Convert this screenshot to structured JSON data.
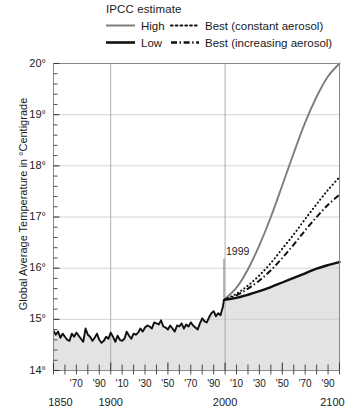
{
  "legend": {
    "title": "IPCC estimate",
    "entries": [
      {
        "label": "High",
        "style": "solid",
        "color": "#7d7d7d",
        "name": "legend-high"
      },
      {
        "label": "Best (constant aerosol)",
        "style": "dotted",
        "color": "#111111",
        "name": "legend-best-constant"
      },
      {
        "label": "Low",
        "style": "solid",
        "color": "#111111",
        "name": "legend-low"
      },
      {
        "label": "Best (increasing aerosol)",
        "style": "dashdot",
        "color": "#111111",
        "name": "legend-best-increasing"
      }
    ]
  },
  "axes": {
    "ylabel": "Global Average Temperature in °Centigrade",
    "yticks": [
      "14°",
      "15°",
      "16°",
      "17°",
      "18°",
      "19°",
      "20°"
    ],
    "xmajor": [
      "1850",
      "1900",
      "2000",
      "2100"
    ],
    "xminor": [
      "'70",
      "'90",
      "'10",
      "'30",
      "'50",
      "'70",
      "'90",
      "'10",
      "'30",
      "'50",
      "'70",
      "'90"
    ]
  },
  "annotations": [
    {
      "text": "1999",
      "name": "annotation-1999",
      "year": 1999
    }
  ],
  "chart_data": {
    "type": "line",
    "title": "IPCC estimate",
    "xlabel": "",
    "ylabel": "Global Average Temperature in °Centigrade",
    "xlim": [
      1850,
      2100
    ],
    "ylim": [
      14,
      20
    ],
    "grid": true,
    "legend_position": "top",
    "yticks": [
      14,
      15,
      16,
      17,
      18,
      19,
      20
    ],
    "xticks_major": [
      1850,
      1900,
      2000,
      2100
    ],
    "xticks_minor": [
      1870,
      1890,
      1910,
      1930,
      1950,
      1970,
      1990,
      2010,
      2030,
      2050,
      2070,
      2090
    ],
    "shaded_region": {
      "below_curve": true,
      "color": "#e3e3e3",
      "description": "area under the observed/low curve is shaded light grey"
    },
    "series": [
      {
        "name": "Observed record",
        "style": "solid",
        "color": "#111111",
        "x": [
          1850,
          1852,
          1854,
          1856,
          1858,
          1860,
          1862,
          1864,
          1866,
          1868,
          1870,
          1872,
          1874,
          1876,
          1878,
          1880,
          1882,
          1884,
          1886,
          1888,
          1890,
          1892,
          1894,
          1896,
          1898,
          1900,
          1902,
          1904,
          1906,
          1908,
          1910,
          1912,
          1914,
          1916,
          1918,
          1920,
          1922,
          1924,
          1926,
          1928,
          1930,
          1932,
          1934,
          1936,
          1938,
          1940,
          1942,
          1944,
          1946,
          1948,
          1950,
          1952,
          1954,
          1956,
          1958,
          1960,
          1962,
          1964,
          1966,
          1968,
          1970,
          1972,
          1974,
          1976,
          1978,
          1980,
          1982,
          1984,
          1986,
          1988,
          1990,
          1992,
          1994,
          1996,
          1998,
          1999
        ],
        "values": [
          14.78,
          14.7,
          14.76,
          14.64,
          14.72,
          14.66,
          14.6,
          14.58,
          14.72,
          14.66,
          14.74,
          14.68,
          14.62,
          14.56,
          14.82,
          14.7,
          14.66,
          14.58,
          14.64,
          14.72,
          14.6,
          14.54,
          14.58,
          14.66,
          14.62,
          14.74,
          14.66,
          14.56,
          14.68,
          14.6,
          14.58,
          14.62,
          14.76,
          14.68,
          14.62,
          14.72,
          14.7,
          14.74,
          14.82,
          14.76,
          14.84,
          14.88,
          14.86,
          14.82,
          14.94,
          14.92,
          14.9,
          14.98,
          14.86,
          14.84,
          14.8,
          14.88,
          14.82,
          14.76,
          14.88,
          14.86,
          14.92,
          14.82,
          14.9,
          14.86,
          14.94,
          14.88,
          14.84,
          14.8,
          14.92,
          15.02,
          14.96,
          14.94,
          15.04,
          15.12,
          15.16,
          15.06,
          15.12,
          15.08,
          15.24,
          15.38
        ]
      },
      {
        "name": "High",
        "style": "solid",
        "color": "#7d7d7d",
        "x": [
          1999,
          2010,
          2020,
          2030,
          2040,
          2050,
          2060,
          2070,
          2080,
          2090,
          2100
        ],
        "values": [
          15.38,
          15.62,
          15.98,
          16.45,
          17.0,
          17.62,
          18.25,
          18.85,
          19.35,
          19.75,
          20.0
        ]
      },
      {
        "name": "Best (constant aerosol)",
        "style": "dotted",
        "color": "#111111",
        "x": [
          1999,
          2010,
          2020,
          2030,
          2040,
          2050,
          2060,
          2070,
          2080,
          2090,
          2100
        ],
        "values": [
          15.38,
          15.5,
          15.66,
          15.86,
          16.1,
          16.38,
          16.66,
          16.96,
          17.25,
          17.53,
          17.78
        ]
      },
      {
        "name": "Best (increasing aerosol)",
        "style": "dashdot",
        "color": "#111111",
        "x": [
          1999,
          2010,
          2020,
          2030,
          2040,
          2050,
          2060,
          2070,
          2080,
          2090,
          2100
        ],
        "values": [
          15.38,
          15.47,
          15.6,
          15.76,
          15.96,
          16.2,
          16.46,
          16.74,
          17.0,
          17.24,
          17.44
        ]
      },
      {
        "name": "Low",
        "style": "solid",
        "color": "#111111",
        "x": [
          1999,
          2010,
          2020,
          2030,
          2040,
          2050,
          2060,
          2070,
          2080,
          2090,
          2100
        ],
        "values": [
          15.38,
          15.42,
          15.48,
          15.55,
          15.63,
          15.72,
          15.81,
          15.9,
          15.99,
          16.06,
          16.12
        ]
      }
    ]
  }
}
